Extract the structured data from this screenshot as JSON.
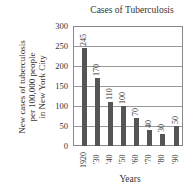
{
  "chart_data": {
    "type": "bar",
    "title": "Cases of Tuberculosis",
    "xlabel": "Years",
    "ylabel": "New cases of tuberculosis per 100,000 people in New York City",
    "ylabel_lines": [
      "New cases of tuberculosis",
      "per 100,000 people",
      "in New York City"
    ],
    "categories": [
      "1920",
      "'30",
      "'40",
      "'50",
      "'60",
      "'70",
      "'80",
      "'90"
    ],
    "values": [
      245,
      170,
      110,
      100,
      70,
      40,
      30,
      50
    ],
    "value_labels": [
      "245",
      "170",
      "110",
      "100",
      "70",
      "40",
      "30",
      "50"
    ],
    "ylim": [
      0,
      300
    ],
    "yticks": [
      "300",
      "250",
      "200",
      "150",
      "100",
      "50",
      "0"
    ],
    "grid": true,
    "bar_color": "#555555"
  }
}
